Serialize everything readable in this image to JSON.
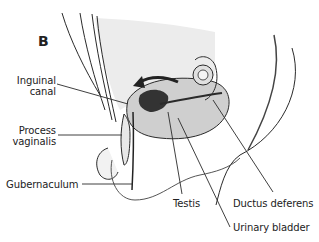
{
  "figure": {
    "panel_letter": "B",
    "labels": {
      "inguinal_canal": [
        "Inguinal",
        "canal"
      ],
      "process_vaginalis": [
        "Process",
        "vaginalis"
      ],
      "gubernaculum": "Gubernaculum",
      "testis": "Testis",
      "ductus_deferens": "Ductus deferens",
      "urinary_bladder": "Urinary bladder"
    },
    "colors": {
      "line": "#2a2a2a",
      "shade_light": "#e6e6e6",
      "shade_mid": "#cfcfcf",
      "shade_dark": "#333333",
      "background": "#ffffff"
    }
  }
}
